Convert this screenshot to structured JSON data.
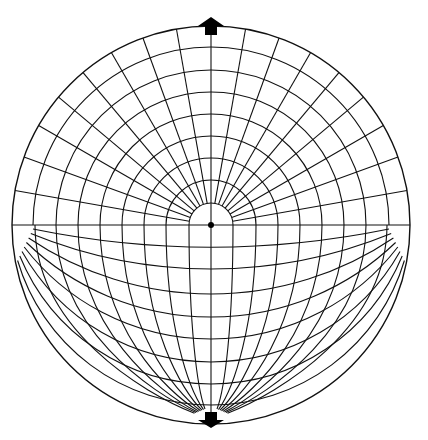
{
  "diagram": {
    "title": "",
    "type": "projection-net",
    "colors": {
      "stroke": "#111111",
      "fill": "#000000",
      "background": "#ffffff"
    },
    "center": {
      "x": 211,
      "y": 225
    },
    "outer_radius": 199,
    "upper_half": {
      "concentric_radii": [
        22,
        45,
        67,
        89,
        111,
        133,
        155,
        178
      ],
      "spoke_step_deg": 10,
      "spoke_inner_radius": 22
    },
    "lower_half": {
      "pole": {
        "x": 211,
        "y": 421
      },
      "meridian_axis_offsets": [
        22,
        45,
        67,
        89,
        111,
        133,
        155,
        176
      ],
      "parallel_axis_crossings_y": [
        247,
        269,
        294,
        317,
        339,
        362,
        384,
        405
      ],
      "parallel_anchor_x_offset": 178
    },
    "markers": {
      "top_arrow": {
        "icon": "arrow-up-icon",
        "tip_y": 17,
        "base_y": 35
      },
      "bottom_arrow": {
        "icon": "arrow-down-icon",
        "tip_y": 428,
        "base_y": 412
      },
      "center_dot": {
        "icon": "center-point-icon",
        "r": 3
      }
    }
  }
}
